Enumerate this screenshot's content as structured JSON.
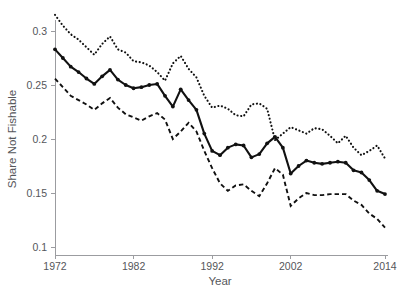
{
  "chart_data": {
    "type": "line",
    "title": "",
    "xlabel": "Year",
    "ylabel": "Share Not Fishable",
    "xlim": [
      1972,
      2014
    ],
    "ylim": [
      0.1,
      0.315
    ],
    "grid": false,
    "legend": null,
    "xticks": [
      1972,
      1982,
      1992,
      2002,
      2014
    ],
    "xtick_labels": [
      "1972",
      "1982",
      "1992",
      "2002",
      "2014"
    ],
    "yticks": [
      0.1,
      0.15,
      0.2,
      0.25,
      0.3
    ],
    "ytick_labels": [
      "0.1",
      "0.15",
      "0.2",
      "0.25",
      "0.3"
    ],
    "x": [
      1972,
      1973,
      1974,
      1975,
      1976,
      1977,
      1978,
      1979,
      1980,
      1981,
      1982,
      1983,
      1984,
      1985,
      1986,
      1987,
      1988,
      1989,
      1990,
      1991,
      1992,
      1993,
      1994,
      1995,
      1996,
      1997,
      1998,
      1999,
      2000,
      2001,
      2002,
      2003,
      2004,
      2005,
      2006,
      2007,
      2008,
      2009,
      2010,
      2011,
      2012,
      2013,
      2014
    ],
    "series": [
      {
        "name": "upper-confidence-bound",
        "style": "dotted",
        "values": [
          0.315,
          0.305,
          0.297,
          0.292,
          0.285,
          0.278,
          0.288,
          0.295,
          0.283,
          0.28,
          0.272,
          0.271,
          0.268,
          0.262,
          0.254,
          0.27,
          0.277,
          0.265,
          0.257,
          0.24,
          0.229,
          0.231,
          0.228,
          0.222,
          0.221,
          0.232,
          0.233,
          0.228,
          0.199,
          0.205,
          0.211,
          0.208,
          0.205,
          0.21,
          0.209,
          0.203,
          0.196,
          0.203,
          0.192,
          0.185,
          0.189,
          0.194,
          0.182
        ]
      },
      {
        "name": "point-estimate",
        "style": "solid-with-markers",
        "values": [
          0.283,
          0.275,
          0.267,
          0.262,
          0.256,
          0.251,
          0.258,
          0.264,
          0.255,
          0.25,
          0.247,
          0.248,
          0.25,
          0.251,
          0.24,
          0.23,
          0.246,
          0.236,
          0.227,
          0.205,
          0.189,
          0.185,
          0.192,
          0.195,
          0.194,
          0.183,
          0.186,
          0.196,
          0.202,
          0.192,
          0.168,
          0.175,
          0.18,
          0.178,
          0.177,
          0.178,
          0.179,
          0.178,
          0.171,
          0.169,
          0.162,
          0.152,
          0.149
        ]
      },
      {
        "name": "lower-confidence-bound",
        "style": "dashed",
        "values": [
          0.256,
          0.248,
          0.24,
          0.236,
          0.232,
          0.227,
          0.233,
          0.238,
          0.229,
          0.223,
          0.22,
          0.217,
          0.221,
          0.224,
          0.218,
          0.2,
          0.207,
          0.215,
          0.207,
          0.189,
          0.173,
          0.159,
          0.152,
          0.157,
          0.158,
          0.152,
          0.147,
          0.159,
          0.173,
          0.167,
          0.138,
          0.145,
          0.15,
          0.148,
          0.148,
          0.149,
          0.149,
          0.149,
          0.143,
          0.139,
          0.131,
          0.126,
          0.118
        ]
      }
    ]
  }
}
